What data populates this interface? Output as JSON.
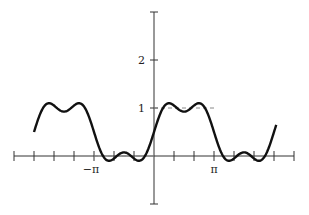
{
  "chart_data": {
    "type": "line",
    "title": "",
    "xlabel": "",
    "ylabel": "",
    "function": "1/2 + (2/pi)*(sin x + sin(3x)/3)",
    "xlim": [
      -7.33,
      7.33
    ],
    "ylim": [
      -1,
      3
    ],
    "x_ticks_step": "pi/3",
    "x_tick_labels": [
      {
        "value": -3.14159,
        "label": "−π"
      },
      {
        "value": 3.14159,
        "label": "π"
      }
    ],
    "y_tick_labels": [
      {
        "value": 1,
        "label": "1"
      },
      {
        "value": 2,
        "label": "2"
      }
    ],
    "grid": false,
    "legend": "none",
    "reference_lines": [
      {
        "y": 1,
        "x_range": [
          0,
          3.14159
        ],
        "style": "dashed"
      },
      {
        "y": 0,
        "x_range": [
          -3.14159,
          0
        ],
        "style": "dashed"
      }
    ],
    "series": [
      {
        "name": "partial Fourier sum",
        "x_range": [
          -6.283,
          6.4
        ],
        "color": "#111111"
      }
    ]
  },
  "labels": {
    "neg_pi": "−π",
    "pi": "π",
    "one": "1",
    "two": "2"
  }
}
